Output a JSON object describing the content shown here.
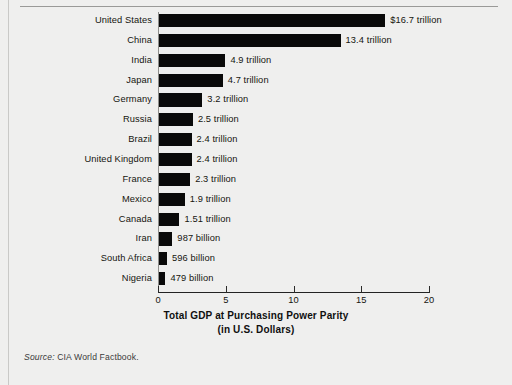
{
  "figure": {
    "source_prefix": "Source:",
    "source_text": " CIA World Factbook.",
    "background_color": "#efefee",
    "bar_color": "#0a0a0a"
  },
  "chart_data": {
    "type": "bar",
    "orientation": "horizontal",
    "title": "",
    "xlabel": "Total GDP at Purchasing Power Parity",
    "xlabel_line2": "(in U.S. Dollars)",
    "ylabel": "",
    "xlim": [
      0,
      20
    ],
    "xticks": [
      0,
      5,
      10,
      15,
      20
    ],
    "xtick_labels": [
      "0",
      "5",
      "10",
      "15",
      "20"
    ],
    "grid": false,
    "legend": false,
    "units": "trillions of U.S. dollars",
    "categories": [
      "United States",
      "China",
      "India",
      "Japan",
      "Germany",
      "Russia",
      "Brazil",
      "United Kingdom",
      "France",
      "Mexico",
      "Canada",
      "Iran",
      "South Africa",
      "Nigeria"
    ],
    "values": [
      16.7,
      13.4,
      4.9,
      4.7,
      3.2,
      2.5,
      2.4,
      2.4,
      2.3,
      1.9,
      1.51,
      0.987,
      0.596,
      0.479
    ],
    "data_labels": [
      "$16.7 trillion",
      "13.4 trillion",
      "4.9 trillion",
      "4.7 trillion",
      "3.2 trillion",
      "2.5 trillion",
      "2.4 trillion",
      "2.4 trillion",
      "2.3 trillion",
      "1.9 trillion",
      "1.51 trillion",
      "987 billion",
      "596 billion",
      "479 billion"
    ]
  }
}
